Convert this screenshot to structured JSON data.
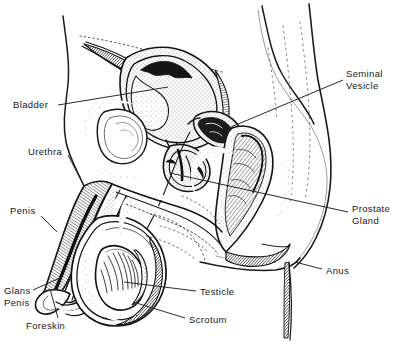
{
  "figure": {
    "type": "anatomical-line-drawing",
    "background_color": "#ffffff",
    "ink_color": "#1a1a1a",
    "label_color": "#181818",
    "leader_color": "#2a2a2a"
  },
  "labels": [
    {
      "id": "bladder",
      "name": "Bladder",
      "lines": [
        "Bladder"
      ],
      "x": 13,
      "y": 99,
      "align": "left",
      "leader": [
        [
          58,
          105
        ],
        [
          168,
          87
        ]
      ]
    },
    {
      "id": "urethra",
      "name": "Urethra",
      "lines": [
        "Urethra"
      ],
      "x": 28,
      "y": 146,
      "align": "left",
      "leader": [
        [
          68,
          155
        ],
        [
          84,
          186
        ]
      ]
    },
    {
      "id": "penis",
      "name": "Penis",
      "lines": [
        "Penis"
      ],
      "x": 10,
      "y": 205,
      "align": "left",
      "leader": [
        [
          41,
          216
        ],
        [
          57,
          232
        ]
      ]
    },
    {
      "id": "glans-penis",
      "name": "Glans Penis",
      "lines": [
        "Glans",
        "Penis"
      ],
      "x": 4,
      "y": 285,
      "align": "left",
      "leader": [
        [
          33,
          290
        ],
        [
          62,
          277
        ]
      ]
    },
    {
      "id": "foreskin",
      "name": "Foreskin",
      "lines": [
        "Foreskin"
      ],
      "x": 26,
      "y": 320,
      "align": "left",
      "leader": [
        [
          58,
          318
        ],
        [
          50,
          289
        ]
      ]
    },
    {
      "id": "seminal-vesicle",
      "name": "Seminal Vesicle",
      "lines": [
        "Seminal",
        "Vesicle"
      ],
      "x": 346,
      "y": 68,
      "align": "left",
      "leader": [
        [
          343,
          80
        ],
        [
          231,
          127
        ]
      ]
    },
    {
      "id": "prostate-gland",
      "name": "Prostate Gland",
      "lines": [
        "Prostate",
        "Gland"
      ],
      "x": 352,
      "y": 203,
      "align": "left",
      "leader": [
        [
          348,
          212
        ],
        [
          170,
          173
        ]
      ]
    },
    {
      "id": "anus",
      "name": "Anus",
      "lines": [
        "Anus"
      ],
      "x": 326,
      "y": 265,
      "align": "left",
      "leader": [
        [
          322,
          269
        ],
        [
          295,
          262
        ]
      ]
    },
    {
      "id": "testicle",
      "name": "Testicle",
      "lines": [
        "Testicle"
      ],
      "x": 200,
      "y": 286,
      "align": "left",
      "leader": [
        [
          196,
          291
        ],
        [
          124,
          282
        ]
      ]
    },
    {
      "id": "scrotum",
      "name": "Scrotum",
      "lines": [
        "Scrotum"
      ],
      "x": 189,
      "y": 314,
      "align": "left",
      "leader": [
        [
          185,
          318
        ],
        [
          133,
          302
        ]
      ]
    }
  ]
}
